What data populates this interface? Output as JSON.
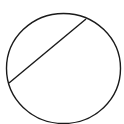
{
  "diagram": {
    "type": "geometry",
    "shapes": [
      {
        "kind": "circle",
        "cx": 63.5,
        "cy": 68.5,
        "rx": 57,
        "ry": 55,
        "stroke": "#1a1a1a",
        "fill": "none"
      },
      {
        "kind": "chord",
        "x1": 9,
        "y1": 83,
        "x2": 86,
        "y2": 19,
        "stroke": "#1a1a1a"
      }
    ],
    "background": "#ffffff"
  }
}
